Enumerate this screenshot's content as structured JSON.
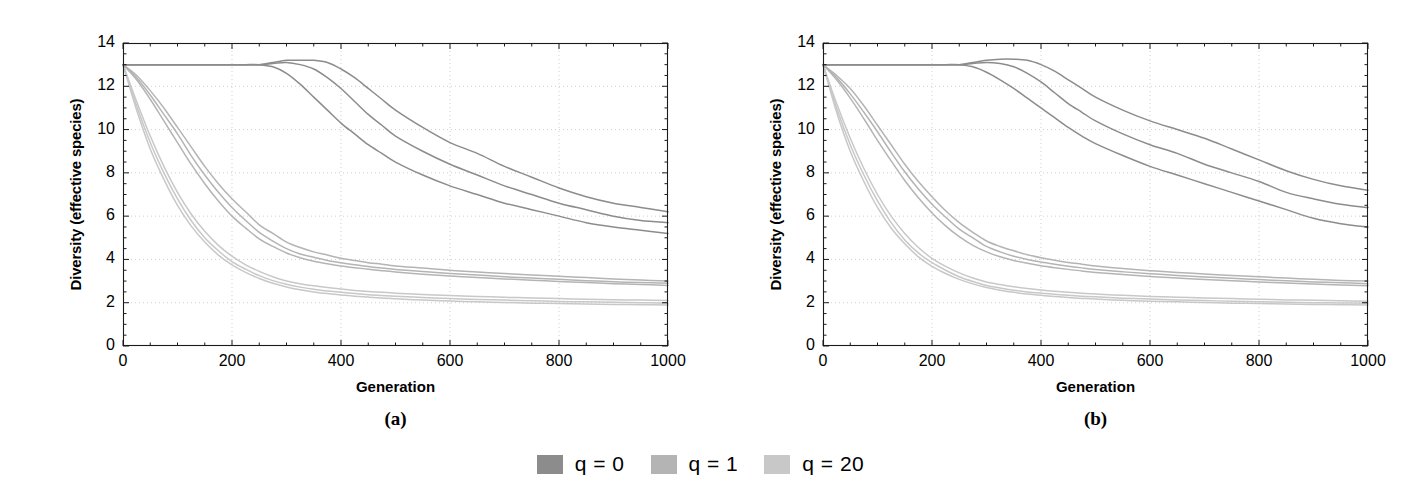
{
  "figure": {
    "background": "#ffffff",
    "panels": [
      {
        "id": "a",
        "caption": "(a)",
        "xlabel": "Generation",
        "ylabel": "Diversity (effective species)"
      },
      {
        "id": "b",
        "caption": "(b)",
        "xlabel": "Generation",
        "ylabel": "Diversity (effective species)"
      }
    ]
  },
  "legend": {
    "position": "bottom-center",
    "entries": [
      {
        "label": "q = 0",
        "color": "#8c8c8c"
      },
      {
        "label": "q = 1",
        "color": "#b4b4b4"
      },
      {
        "label": "q = 20",
        "color": "#c8c8c8"
      }
    ]
  },
  "axes": {
    "xlim": [
      0,
      1000
    ],
    "ylim": [
      0,
      14
    ],
    "xticks": [
      0,
      200,
      400,
      600,
      800,
      1000
    ],
    "xticks_labels": [
      "0",
      "200",
      "400",
      "600",
      "800",
      "1000"
    ],
    "yticks": [
      0,
      2,
      4,
      6,
      8,
      10,
      12,
      14
    ],
    "yticks_labels": [
      "0",
      "2",
      "4",
      "6",
      "8",
      "10",
      "12",
      "14"
    ],
    "xminor_step": 50,
    "yminor_step": 0.5,
    "grid": true,
    "grid_style": "dotted",
    "grid_color": "#c9c9c9",
    "frame_color": "#1a1a1a",
    "tick_color": "#1a1a1a"
  },
  "chart_data": {
    "type": "line",
    "title": "",
    "xlabel": "Generation",
    "ylabel": "Diversity (effective species)",
    "xlim": [
      0,
      1000
    ],
    "ylim": [
      0,
      14
    ],
    "grid": true,
    "legend_position": "bottom-center",
    "legend_entries": [
      "q = 0",
      "q = 1",
      "q = 20"
    ],
    "x": [
      0,
      25,
      50,
      75,
      100,
      125,
      150,
      175,
      200,
      225,
      250,
      275,
      300,
      325,
      350,
      375,
      400,
      425,
      450,
      475,
      500,
      550,
      600,
      650,
      700,
      750,
      800,
      850,
      900,
      950,
      1000
    ],
    "panels": [
      {
        "id": "a",
        "caption": "(a)",
        "series": [
          {
            "name": "q = 0",
            "group": "q = 0",
            "color": "#8c8c8c",
            "replicate": 1,
            "values": [
              13.0,
              13.0,
              13.0,
              13.0,
              13.0,
              13.0,
              13.0,
              13.0,
              13.0,
              13.0,
              13.0,
              13.1,
              13.2,
              13.2,
              13.2,
              13.1,
              12.8,
              12.4,
              11.9,
              11.4,
              10.9,
              10.1,
              9.4,
              8.9,
              8.3,
              7.8,
              7.3,
              6.9,
              6.6,
              6.4,
              6.2
            ]
          },
          {
            "name": "q = 0",
            "group": "q = 0",
            "color": "#8c8c8c",
            "replicate": 2,
            "values": [
              13.0,
              13.0,
              13.0,
              13.0,
              13.0,
              13.0,
              13.0,
              13.0,
              13.0,
              13.0,
              13.0,
              13.05,
              13.1,
              13.0,
              12.8,
              12.4,
              11.9,
              11.3,
              10.7,
              10.2,
              9.7,
              9.0,
              8.4,
              7.9,
              7.4,
              7.0,
              6.6,
              6.3,
              6.0,
              5.8,
              5.7
            ]
          },
          {
            "name": "q = 0",
            "group": "q = 0",
            "color": "#8c8c8c",
            "replicate": 3,
            "values": [
              13.0,
              13.0,
              13.0,
              13.0,
              13.0,
              13.0,
              13.0,
              13.0,
              13.0,
              13.0,
              13.0,
              12.9,
              12.6,
              12.1,
              11.5,
              10.9,
              10.3,
              9.8,
              9.3,
              8.9,
              8.5,
              7.9,
              7.4,
              7.0,
              6.6,
              6.3,
              6.0,
              5.7,
              5.5,
              5.35,
              5.2
            ]
          },
          {
            "name": "q = 1",
            "group": "q = 1",
            "color": "#b4b4b4",
            "replicate": 1,
            "values": [
              13.0,
              12.5,
              11.8,
              11.0,
              10.1,
              9.2,
              8.3,
              7.5,
              6.8,
              6.2,
              5.6,
              5.2,
              4.8,
              4.55,
              4.35,
              4.2,
              4.05,
              3.95,
              3.85,
              3.78,
              3.7,
              3.6,
              3.5,
              3.42,
              3.35,
              3.28,
              3.22,
              3.16,
              3.1,
              3.05,
              3.0
            ]
          },
          {
            "name": "q = 1",
            "group": "q = 1",
            "color": "#b4b4b4",
            "replicate": 2,
            "values": [
              13.0,
              12.4,
              11.6,
              10.7,
              9.8,
              8.8,
              7.9,
              7.1,
              6.4,
              5.8,
              5.25,
              4.85,
              4.5,
              4.25,
              4.1,
              3.95,
              3.85,
              3.75,
              3.67,
              3.6,
              3.54,
              3.44,
              3.35,
              3.28,
              3.2,
              3.14,
              3.08,
              3.02,
              2.97,
              2.93,
              2.9
            ]
          },
          {
            "name": "q = 1",
            "group": "q = 1",
            "color": "#b4b4b4",
            "replicate": 3,
            "values": [
              13.0,
              12.3,
              11.4,
              10.4,
              9.4,
              8.4,
              7.5,
              6.7,
              6.0,
              5.45,
              4.95,
              4.6,
              4.3,
              4.08,
              3.92,
              3.8,
              3.7,
              3.62,
              3.55,
              3.48,
              3.42,
              3.32,
              3.24,
              3.16,
              3.1,
              3.04,
              2.98,
              2.93,
              2.88,
              2.84,
              2.8
            ]
          },
          {
            "name": "q = 20",
            "group": "q = 20",
            "color": "#c8c8c8",
            "replicate": 1,
            "values": [
              13.0,
              11.3,
              9.7,
              8.3,
              7.1,
              6.1,
              5.3,
              4.65,
              4.15,
              3.75,
              3.45,
              3.2,
              3.0,
              2.88,
              2.78,
              2.7,
              2.63,
              2.57,
              2.52,
              2.48,
              2.44,
              2.38,
              2.33,
              2.29,
              2.25,
              2.22,
              2.19,
              2.16,
              2.14,
              2.12,
              2.1
            ]
          },
          {
            "name": "q = 20",
            "group": "q = 20",
            "color": "#c8c8c8",
            "replicate": 2,
            "values": [
              13.0,
              11.1,
              9.4,
              8.0,
              6.8,
              5.8,
              5.0,
              4.4,
              3.9,
              3.55,
              3.25,
              3.02,
              2.85,
              2.72,
              2.62,
              2.54,
              2.48,
              2.42,
              2.37,
              2.33,
              2.3,
              2.24,
              2.19,
              2.15,
              2.12,
              2.09,
              2.06,
              2.04,
              2.02,
              2.0,
              1.98
            ]
          },
          {
            "name": "q = 20",
            "group": "q = 20",
            "color": "#c8c8c8",
            "replicate": 3,
            "values": [
              13.0,
              10.9,
              9.1,
              7.7,
              6.5,
              5.55,
              4.8,
              4.2,
              3.75,
              3.4,
              3.12,
              2.9,
              2.73,
              2.6,
              2.5,
              2.42,
              2.36,
              2.3,
              2.26,
              2.22,
              2.18,
              2.12,
              2.08,
              2.04,
              2.01,
              1.98,
              1.96,
              1.94,
              1.92,
              1.91,
              1.9
            ]
          }
        ]
      },
      {
        "id": "b",
        "caption": "(b)",
        "series": [
          {
            "name": "q = 0",
            "group": "q = 0",
            "color": "#8c8c8c",
            "replicate": 1,
            "values": [
              13.0,
              13.0,
              13.0,
              13.0,
              13.0,
              13.0,
              13.0,
              13.0,
              13.0,
              13.0,
              13.0,
              13.1,
              13.2,
              13.25,
              13.25,
              13.2,
              13.0,
              12.7,
              12.3,
              11.9,
              11.5,
              10.9,
              10.4,
              10.0,
              9.6,
              9.1,
              8.6,
              8.1,
              7.7,
              7.4,
              7.2
            ]
          },
          {
            "name": "q = 0",
            "group": "q = 0",
            "color": "#8c8c8c",
            "replicate": 2,
            "values": [
              13.0,
              13.0,
              13.0,
              13.0,
              13.0,
              13.0,
              13.0,
              13.0,
              13.0,
              13.0,
              13.0,
              13.05,
              13.1,
              13.05,
              12.9,
              12.6,
              12.2,
              11.7,
              11.2,
              10.8,
              10.4,
              9.8,
              9.3,
              8.9,
              8.4,
              8.0,
              7.6,
              7.1,
              6.8,
              6.55,
              6.4
            ]
          },
          {
            "name": "q = 0",
            "group": "q = 0",
            "color": "#8c8c8c",
            "replicate": 3,
            "values": [
              13.0,
              13.0,
              13.0,
              13.0,
              13.0,
              13.0,
              13.0,
              13.0,
              13.0,
              13.0,
              13.0,
              12.9,
              12.65,
              12.3,
              11.9,
              11.45,
              11.0,
              10.55,
              10.1,
              9.7,
              9.35,
              8.8,
              8.3,
              7.9,
              7.5,
              7.1,
              6.7,
              6.3,
              5.9,
              5.65,
              5.5
            ]
          },
          {
            "name": "q = 1",
            "group": "q = 1",
            "color": "#b4b4b4",
            "replicate": 1,
            "values": [
              13.0,
              12.5,
              11.9,
              11.1,
              10.2,
              9.3,
              8.4,
              7.6,
              6.9,
              6.25,
              5.7,
              5.25,
              4.85,
              4.6,
              4.4,
              4.22,
              4.08,
              3.96,
              3.86,
              3.78,
              3.7,
              3.58,
              3.48,
              3.4,
              3.33,
              3.26,
              3.2,
              3.14,
              3.08,
              3.03,
              3.0
            ]
          },
          {
            "name": "q = 1",
            "group": "q = 1",
            "color": "#b4b4b4",
            "replicate": 2,
            "values": [
              13.0,
              12.4,
              11.65,
              10.8,
              9.9,
              8.95,
              8.05,
              7.25,
              6.55,
              5.95,
              5.4,
              5.0,
              4.6,
              4.35,
              4.15,
              4.0,
              3.88,
              3.78,
              3.69,
              3.61,
              3.54,
              3.43,
              3.34,
              3.26,
              3.19,
              3.13,
              3.07,
              3.01,
              2.96,
              2.92,
              2.88
            ]
          },
          {
            "name": "q = 1",
            "group": "q = 1",
            "color": "#b4b4b4",
            "replicate": 3,
            "values": [
              13.0,
              12.3,
              11.45,
              10.5,
              9.5,
              8.55,
              7.65,
              6.85,
              6.15,
              5.55,
              5.05,
              4.65,
              4.35,
              4.12,
              3.95,
              3.82,
              3.71,
              3.62,
              3.54,
              3.47,
              3.4,
              3.3,
              3.21,
              3.14,
              3.07,
              3.01,
              2.96,
              2.91,
              2.86,
              2.82,
              2.78
            ]
          },
          {
            "name": "q = 20",
            "group": "q = 20",
            "color": "#c8c8c8",
            "replicate": 1,
            "values": [
              13.0,
              11.2,
              9.6,
              8.2,
              7.0,
              6.0,
              5.2,
              4.55,
              4.05,
              3.68,
              3.38,
              3.14,
              2.96,
              2.84,
              2.74,
              2.66,
              2.59,
              2.53,
              2.48,
              2.44,
              2.4,
              2.34,
              2.29,
              2.25,
              2.22,
              2.19,
              2.16,
              2.13,
              2.11,
              2.09,
              2.07
            ]
          },
          {
            "name": "q = 20",
            "group": "q = 20",
            "color": "#c8c8c8",
            "replicate": 2,
            "values": [
              13.0,
              11.0,
              9.3,
              7.9,
              6.7,
              5.7,
              4.9,
              4.3,
              3.85,
              3.5,
              3.2,
              2.98,
              2.8,
              2.68,
              2.58,
              2.5,
              2.44,
              2.39,
              2.34,
              2.3,
              2.27,
              2.21,
              2.17,
              2.13,
              2.1,
              2.07,
              2.05,
              2.02,
              2.0,
              1.99,
              1.97
            ]
          },
          {
            "name": "q = 20",
            "group": "q = 20",
            "color": "#c8c8c8",
            "replicate": 3,
            "values": [
              13.0,
              10.8,
              9.0,
              7.6,
              6.4,
              5.45,
              4.72,
              4.12,
              3.68,
              3.35,
              3.08,
              2.87,
              2.7,
              2.58,
              2.48,
              2.4,
              2.34,
              2.29,
              2.24,
              2.2,
              2.17,
              2.11,
              2.07,
              2.04,
              2.01,
              1.98,
              1.96,
              1.94,
              1.92,
              1.91,
              1.89
            ]
          }
        ]
      }
    ]
  }
}
